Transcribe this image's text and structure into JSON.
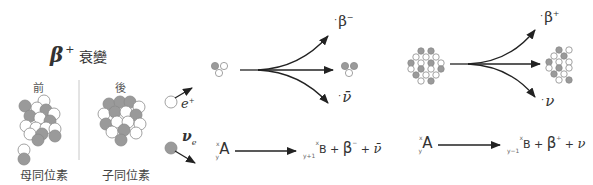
{
  "title": {
    "symbol": "β",
    "charge": "+",
    "text": "衰變"
  },
  "before_after": {
    "before_label": "前",
    "after_label": "後",
    "parent_caption": "母同位素",
    "daughter_caption": "子同位素"
  },
  "emitted": {
    "positron": {
      "symbol": "e",
      "charge": "+"
    },
    "neutrino": {
      "symbol": "ν",
      "subscript": "e"
    }
  },
  "beta_minus": {
    "products": {
      "top": "β",
      "top_charge": "−",
      "bottom": "ν̄"
    },
    "equation": {
      "parent_mass": "x",
      "parent_atomic": "y",
      "parent": "A",
      "daughter_mass": "x",
      "daughter_atomic": "y+1",
      "daughter": "B",
      "plus1": "+",
      "beta": "β",
      "beta_charge": "−",
      "plus2": "+",
      "nu": "ν̄"
    }
  },
  "beta_plus": {
    "products": {
      "top": "β",
      "top_charge": "+",
      "bottom": "ν"
    },
    "equation": {
      "parent_mass": "x",
      "parent_atomic": "y",
      "parent": "A",
      "daughter_mass": "x",
      "daughter_atomic": "y−1",
      "daughter": "B",
      "plus1": "+",
      "beta": "β",
      "beta_charge": "+",
      "plus2": "+",
      "nu": "ν"
    }
  },
  "colors": {
    "proton": "#9a9a9a",
    "neutron": "#ffffff",
    "outline": "#8a8a8a",
    "arrow": "#222222",
    "text": "#333333"
  }
}
